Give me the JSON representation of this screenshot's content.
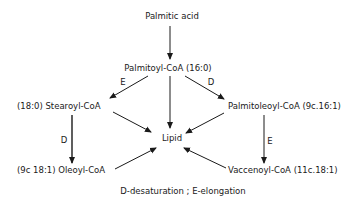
{
  "diagram": {
    "nodes": {
      "palmitic_acid": "Palmitic acid",
      "palmitoyl_coa": "Palmitoyl-CoA (16:0)",
      "stearoyl_coa": "(18:0) Stearoyl-CoA",
      "palmitoleoyl_coa": "Palmitoleoyl-CoA (9c.16:1)",
      "lipid": "Lipid",
      "oleoyl_coa": "(9c 18:1) Oleoyl-CoA",
      "vaccenoyl_coa": "Vaccenoyl-CoA (11c.18:1)"
    },
    "edges": [
      {
        "from": "palmitic_acid",
        "to": "palmitoyl_coa",
        "label": ""
      },
      {
        "from": "palmitoyl_coa",
        "to": "stearoyl_coa",
        "label": "E"
      },
      {
        "from": "palmitoyl_coa",
        "to": "palmitoleoyl_coa",
        "label": "D"
      },
      {
        "from": "palmitoyl_coa",
        "to": "lipid",
        "label": ""
      },
      {
        "from": "stearoyl_coa",
        "to": "lipid",
        "label": ""
      },
      {
        "from": "palmitoleoyl_coa",
        "to": "lipid",
        "label": ""
      },
      {
        "from": "stearoyl_coa",
        "to": "oleoyl_coa",
        "label": "D"
      },
      {
        "from": "palmitoleoyl_coa",
        "to": "vaccenoyl_coa",
        "label": "E"
      },
      {
        "from": "oleoyl_coa",
        "to": "lipid",
        "label": ""
      },
      {
        "from": "vaccenoyl_coa",
        "to": "lipid",
        "label": ""
      }
    ],
    "edge_labels": {
      "e_to_stearoyl": "E",
      "d_to_palmitoleoyl": "D",
      "d_to_oleoyl": "D",
      "e_to_vaccenoyl": "E"
    },
    "legend": "D-desaturation ; E-elongation"
  }
}
